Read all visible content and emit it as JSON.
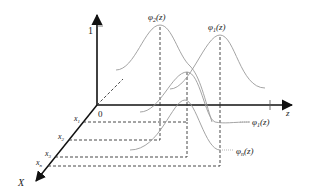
{
  "diagram": {
    "type": "3d-membership-functions",
    "axes": {
      "vertical": {
        "tick_label": "1"
      },
      "horizontal": {
        "label": "z"
      },
      "depth": {
        "label": "X"
      },
      "origin_label": "0"
    },
    "x_ticks": [
      {
        "base": "x",
        "sub": "1"
      },
      {
        "base": "x",
        "sub": "2"
      },
      {
        "base": "x",
        "sub": "3"
      },
      {
        "base": "x",
        "sub": "n"
      }
    ],
    "curves": [
      {
        "base": "φ",
        "sub": "2",
        "arg": "(z)"
      },
      {
        "base": "φ",
        "sub": "1",
        "arg": "(z)"
      },
      {
        "base": "φ",
        "sub": "1",
        "arg": "(z)"
      },
      {
        "base": "φ",
        "sub": "n",
        "arg": "(z)"
      }
    ],
    "colors": {
      "axis": "#111111",
      "curve": "#9a9a9a",
      "dashed": "#333333"
    }
  }
}
